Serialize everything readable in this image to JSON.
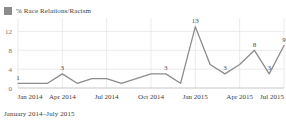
{
  "legend": {
    "label": "% Race Relations/Racism",
    "swatch_color": "#8c8c8c",
    "icon": "legend-square-icon"
  },
  "caption": "January 2014–July 2015",
  "chart_data": {
    "type": "line",
    "title": "",
    "subtitle": "",
    "xlabel": "",
    "ylabel": "",
    "series": [
      {
        "name": "% Race Relations/Racism",
        "color": "#8c8c8c",
        "values": [
          1,
          1,
          1,
          3,
          1,
          2,
          2,
          1,
          2,
          3,
          3,
          1,
          13,
          5,
          3,
          5,
          8,
          3,
          9
        ]
      }
    ],
    "x": [
      "Jan 2014",
      "Feb 2014",
      "Mar 2014",
      "Apr 2014",
      "May 2014",
      "Jun 2014",
      "Jul 2014",
      "Aug 2014",
      "Sep 2014",
      "Oct 2014",
      "Nov 2014",
      "Dec 2014",
      "Jan 2015",
      "Feb 2015",
      "Mar 2015",
      "Apr 2015",
      "May 2015",
      "Jun 2015",
      "Jul 2015"
    ],
    "point_labels": [
      {
        "index": 0,
        "text": "1"
      },
      {
        "index": 3,
        "text": "3"
      },
      {
        "index": 10,
        "text": "3"
      },
      {
        "index": 12,
        "text": "13"
      },
      {
        "index": 14,
        "text": "3"
      },
      {
        "index": 16,
        "text": "8"
      },
      {
        "index": 17,
        "text": "3"
      },
      {
        "index": 18,
        "text": "9"
      }
    ],
    "ylim": [
      0,
      14
    ],
    "yticks": [
      "0",
      "4",
      "8",
      "12"
    ],
    "ytick_values": [
      0,
      4,
      8,
      12
    ],
    "xticks": [
      "Jan 2014",
      "Apr 2014",
      "Jul 2014",
      "Oct 2014",
      "Jan 2015",
      "Apr 2015",
      "Jul 2015"
    ],
    "xtick_indices": [
      0,
      3,
      6,
      9,
      12,
      15,
      18
    ],
    "grid": true,
    "legend_position": "top-left"
  }
}
